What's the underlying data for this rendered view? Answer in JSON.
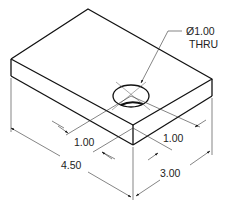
{
  "drawing": {
    "title": "Isometric view of rectangular plate with through hole",
    "hole_callout": {
      "diameter": "Ø1.00",
      "note": "THRU"
    },
    "dimensions": {
      "hole_offset_left": "1.00",
      "hole_offset_right": "1.00",
      "length": "4.50",
      "width": "3.00"
    },
    "line_color": "#111111"
  }
}
